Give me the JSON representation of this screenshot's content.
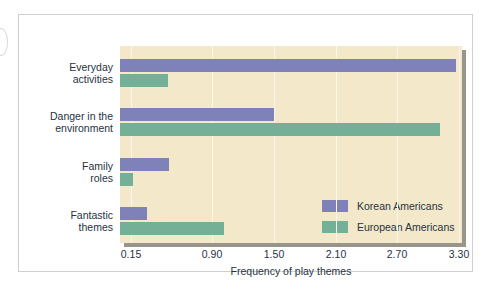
{
  "chart_data": {
    "type": "bar",
    "orientation": "horizontal",
    "title": "",
    "xlabel": "Frequency of play themes",
    "ylabel": "",
    "categories": [
      "Everyday activities",
      "Danger in the environment",
      "Family roles",
      "Fantastic themes"
    ],
    "category_lines": [
      [
        "Everyday",
        "activities"
      ],
      [
        "Danger in the",
        "environment"
      ],
      [
        "Family",
        "roles"
      ],
      [
        "Fantastic",
        "themes"
      ]
    ],
    "series": [
      {
        "name": "Korean Americans",
        "color": "#7e82b8",
        "values": [
          3.27,
          1.5,
          0.5,
          0.3
        ]
      },
      {
        "name": "European Americans",
        "color": "#74b098",
        "values": [
          0.49,
          3.12,
          0.17,
          1.02
        ]
      }
    ],
    "xticks": [
      0.15,
      0.9,
      1.5,
      2.1,
      2.7,
      3.3
    ],
    "xtick_labels": [
      "0.15",
      "0.90",
      "1.50",
      "2.10",
      "2.70",
      "3.30"
    ],
    "xlim": [
      0.105,
      3.3
    ],
    "grid": true,
    "grid_axis": "x",
    "legend_position": "inside-lower-right",
    "plot_background": "#f3e9ca",
    "figure_background": "#ffffff"
  },
  "legend": {
    "entries": [
      {
        "label": "Korean Americans",
        "color": "#7e82b8"
      },
      {
        "label": "European Americans",
        "color": "#74b098"
      }
    ]
  },
  "axis": {
    "x_title": "Frequency of play themes",
    "tick_labels": [
      "0.15",
      "0.90",
      "1.50",
      "2.10",
      "2.70",
      "3.30"
    ]
  }
}
